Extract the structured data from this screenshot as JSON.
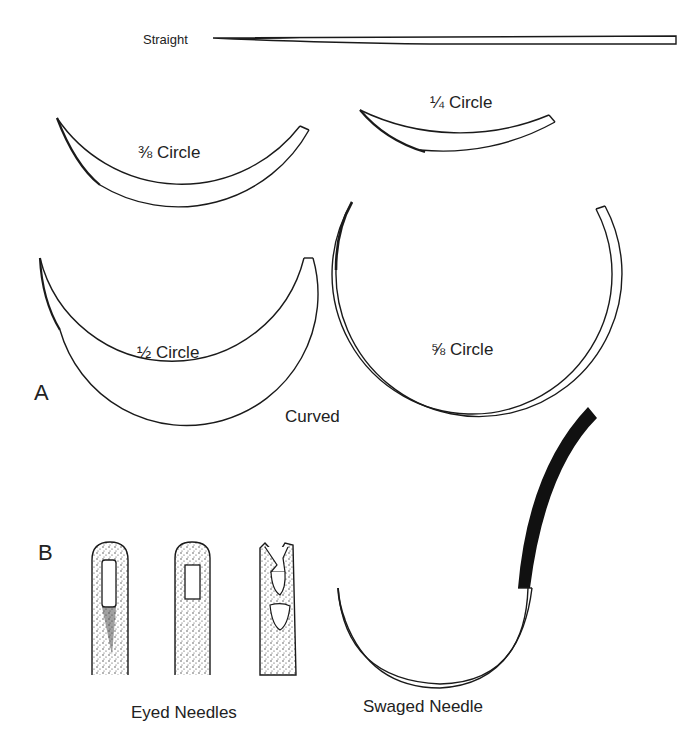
{
  "figure": {
    "panels": [
      {
        "id": "A",
        "label": "A",
        "caption": "Curved",
        "needles": [
          {
            "name": "straight",
            "label": "Straight"
          },
          {
            "name": "three-eighths-circle",
            "label": "⅜ Circle"
          },
          {
            "name": "quarter-circle",
            "label": "¼ Circle"
          },
          {
            "name": "half-circle",
            "label": "½ Circle"
          },
          {
            "name": "five-eighths-circle",
            "label": "⅝ Circle"
          }
        ]
      },
      {
        "id": "B",
        "label": "B",
        "groups": [
          {
            "name": "eyed-needles",
            "label": "Eyed Needles",
            "count": 3
          },
          {
            "name": "swaged-needle",
            "label": "Swaged Needle"
          }
        ]
      }
    ],
    "colors": {
      "ink": "#1a1a1a",
      "paper": "#ffffff",
      "stipple": "#333333"
    }
  }
}
